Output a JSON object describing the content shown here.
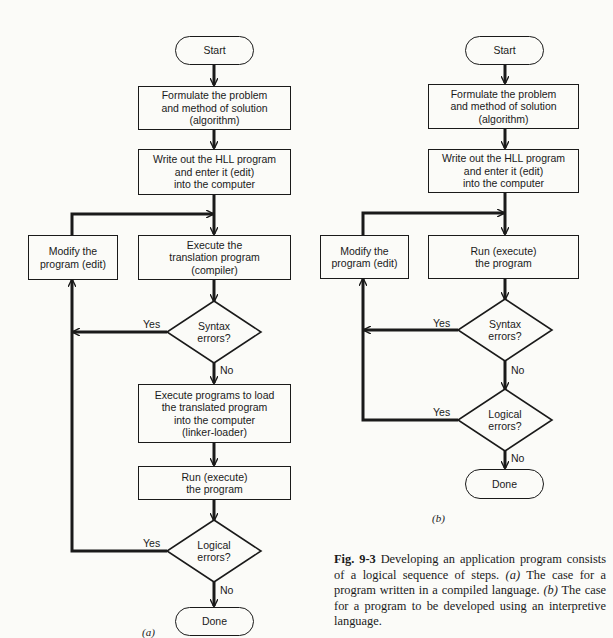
{
  "figure": {
    "panel_a": {
      "label": "(a)",
      "nodes": {
        "start": "Start",
        "formulate": "Formulate the problem\nand method of solution\n(algorithm)",
        "write": "Write out the HLL program\nand enter it (edit)\ninto the computer",
        "modify": "Modify the\nprogram (edit)",
        "execute_translation": "Execute the\ntranslation program\n(compiler)",
        "syntax": "Syntax\nerrors?",
        "execute_load": "Execute programs to load\nthe translated program\ninto the computer\n(linker-loader)",
        "run": "Run (execute)\nthe program",
        "logical": "Logical\nerrors?",
        "done": "Done"
      },
      "edge_labels": {
        "syntax_yes": "Yes",
        "syntax_no": "No",
        "logical_yes": "Yes",
        "logical_no": "No"
      }
    },
    "panel_b": {
      "label": "(b)",
      "nodes": {
        "start": "Start",
        "formulate": "Formulate the problem\nand method of solution\n(algorithm)",
        "write": "Write out the HLL program\nand enter it (edit)\ninto the computer",
        "modify": "Modify the\nprogram (edit)",
        "run": "Run (execute)\nthe program",
        "syntax": "Syntax\nerrors?",
        "logical": "Logical\nerrors?",
        "done": "Done"
      },
      "edge_labels": {
        "syntax_yes": "Yes",
        "syntax_no": "No",
        "logical_yes": "Yes",
        "logical_no": "No"
      }
    },
    "caption": {
      "fig_number": "Fig. 9-3",
      "text_1": " Developing an application program consists of a logical sequence of steps. ",
      "a_marker": "(a)",
      "text_2": " The case for a program written in a compiled language. ",
      "b_marker": "(b)",
      "text_3": " The case for a program to be developed using an interpretive language."
    }
  }
}
